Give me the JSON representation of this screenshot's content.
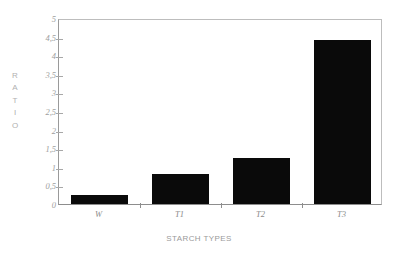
{
  "chart_data": {
    "type": "bar",
    "title": "",
    "subtitle": "",
    "xlabel": "STARCH TYPES",
    "ylabel": "RATIO",
    "ylabel_letters": [
      "R",
      "A",
      "T",
      "I",
      "O"
    ],
    "categories": [
      "W",
      "T1",
      "T2",
      "T3"
    ],
    "values": [
      0.24,
      0.81,
      1.24,
      4.41
    ],
    "series": [
      {
        "name": "Ratio",
        "values": [
          0.24,
          0.81,
          1.24,
          4.41
        ]
      }
    ],
    "ylim": [
      0,
      5
    ],
    "ytick_values": [
      0,
      0.5,
      1,
      1.5,
      2,
      2.5,
      3,
      3.5,
      4,
      4.5,
      5
    ],
    "ytick_labels": [
      "0",
      "0,5",
      "1",
      "1,5",
      "2",
      "2,5",
      "3",
      "3,5",
      "4",
      "4,5",
      "5"
    ],
    "grid": false,
    "legend": false,
    "legend_position": "none",
    "bar_color": "#0a0a0a",
    "frame_color": "#bdbdbd",
    "axis_text_color": "#9a9a9a",
    "decimal_separator": ","
  }
}
